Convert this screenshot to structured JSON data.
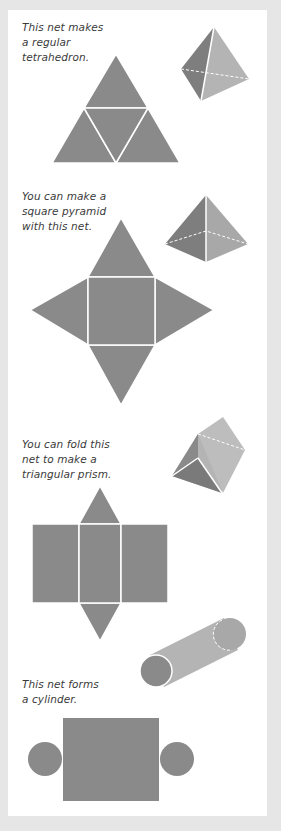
{
  "colors": {
    "background": "#e6e6e6",
    "paper": "#ffffff",
    "net": "#8a8a8a",
    "dark_face": "#7e7e7e",
    "light_face": "#b4b4b4",
    "edge": "#ffffff",
    "text": "#3a3a3a"
  },
  "sections": [
    {
      "name": "tetrahedron",
      "caption_lines": [
        "This net makes",
        "a regular",
        "tetrahedron."
      ]
    },
    {
      "name": "square-pyramid",
      "caption_lines": [
        "You can make a",
        "square pyramid",
        "with this net."
      ]
    },
    {
      "name": "triangular-prism",
      "caption_lines": [
        "You can fold this",
        "net to make a",
        "triangular prism."
      ]
    },
    {
      "name": "cylinder",
      "caption_lines": [
        "This net forms",
        "a cylinder."
      ]
    }
  ]
}
